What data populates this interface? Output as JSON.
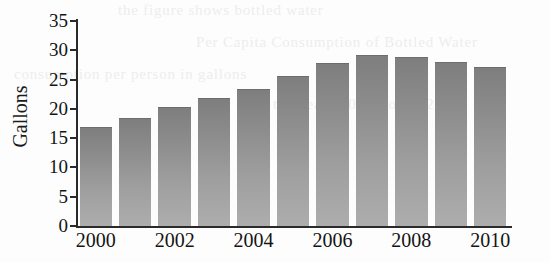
{
  "figure": {
    "y_axis_title": "Gallons",
    "background_color": "#fdfdfd",
    "bar_color_top": "#7e7e7e",
    "bar_color_bottom": "#adadad",
    "axis_color": "#2a2a2a"
  },
  "scan_artifacts": {
    "bleed_lines": [
      "the figure shows bottled water",
      "Per Capita Consumption of Bottled Water",
      "consumption per person in gallons",
      "from the year 2000 through 2010"
    ]
  },
  "chart_data": {
    "type": "bar",
    "title": "",
    "xlabel": "",
    "ylabel": "Gallons",
    "categories": [
      "2000",
      "2001",
      "2002",
      "2003",
      "2004",
      "2005",
      "2006",
      "2007",
      "2008",
      "2009",
      "2010"
    ],
    "values": [
      16.7,
      18.2,
      20.1,
      21.7,
      23.3,
      25.5,
      27.6,
      29.0,
      28.7,
      27.8,
      27.0
    ],
    "ylim": [
      0,
      35
    ],
    "y_ticks": [
      0,
      5,
      10,
      15,
      20,
      25,
      30,
      35
    ],
    "y_tick_labels": [
      "0",
      "5",
      "10",
      "15",
      "20",
      "25",
      "30",
      "35"
    ],
    "x_tick_labels": [
      "2000",
      "2002",
      "2004",
      "2006",
      "2008",
      "2010"
    ],
    "x_tick_categories": [
      "2000",
      "2002",
      "2004",
      "2006",
      "2008",
      "2010"
    ],
    "grid": false,
    "legend": null
  }
}
